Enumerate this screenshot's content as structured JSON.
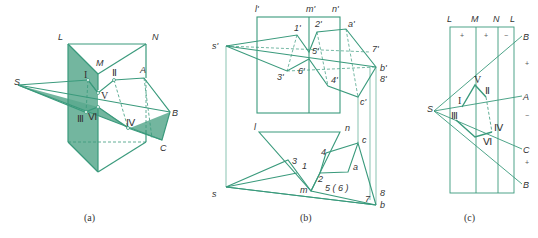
{
  "figure": {
    "panels": [
      {
        "id": "a",
        "caption": "(a)",
        "labels": {
          "L": "L",
          "M": "M",
          "N": "N",
          "S": "S",
          "A": "A",
          "B": "B",
          "C": "C",
          "I": "I",
          "II": "Ⅱ",
          "III": "Ⅲ",
          "IV": "Ⅳ",
          "V": "V",
          "VI": "Ⅵ"
        }
      },
      {
        "id": "b",
        "caption": "(b)",
        "labels": {
          "l1": "l'",
          "m1": "m'",
          "n1": "n'",
          "s1": "s'",
          "a1": "a'",
          "b1": "b'",
          "c1": "c'",
          "p1": "1'",
          "p2": "2'",
          "p3": "3'",
          "p4": "4'",
          "p5": "5'",
          "p6": "6'",
          "p7": "7'",
          "p8": "8'",
          "l": "l",
          "m": "m",
          "n": "n",
          "s": "s",
          "a": "a",
          "b": "b",
          "c": "c",
          "q1": "1",
          "q2": "2",
          "q3": "3",
          "q4": "4",
          "q56": "5 ( 6 )",
          "q7": "7",
          "q8": "8"
        }
      },
      {
        "id": "c",
        "caption": "(c)",
        "labels": {
          "top": [
            "L",
            "M",
            "N",
            "L"
          ],
          "S": "S",
          "A": "A",
          "B_top": "B",
          "B_bot": "B",
          "C": "C",
          "I": "I",
          "II": "Ⅱ",
          "III": "Ⅲ",
          "IV": "Ⅳ",
          "V": "V",
          "VI": "Ⅵ"
        },
        "signs_strip": [
          "+",
          "+",
          "−"
        ],
        "signs_right": [
          "+",
          "−",
          "+"
        ]
      }
    ],
    "colors": {
      "line": "#3a9a7c",
      "fill": "#5aa98e",
      "fill_light": "#8cc7b2",
      "text": "#333333"
    }
  }
}
